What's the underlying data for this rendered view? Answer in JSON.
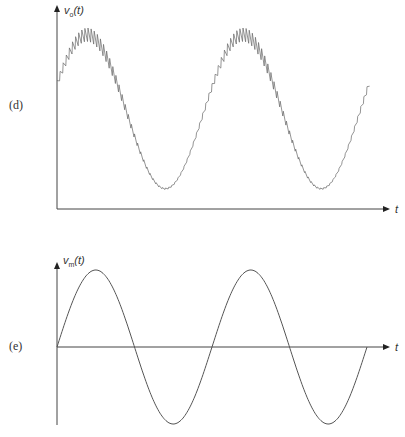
{
  "panels": [
    {
      "label": "(d)",
      "y_axis_label": "v",
      "y_axis_subscript": "o",
      "y_axis_arg": "(t)",
      "x_axis_label": "t",
      "description": "Sinusoid with superimposed high-frequency ripple (demodulated output)"
    },
    {
      "label": "(e)",
      "y_axis_label": "v",
      "y_axis_subscript": "m",
      "y_axis_arg": "(t)",
      "x_axis_label": "t",
      "description": "Pure sinusoid (message signal)"
    }
  ],
  "colors": {
    "stroke": "#555555",
    "axis": "#444444",
    "text": "#333333"
  }
}
